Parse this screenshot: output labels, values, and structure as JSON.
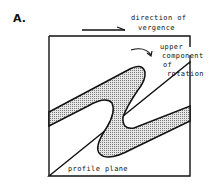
{
  "panel_label": "A.",
  "labels": {
    "direction_line1": "direction of",
    "direction_line2": "vergence",
    "rotation_line1": "upper",
    "rotation_line2": "component",
    "rotation_line3": "of",
    "rotation_line4": "rotation",
    "profile_plane": "profile plane"
  },
  "colors": {
    "ink": "#111111",
    "fill": "#cfcfcf",
    "background": "#ffffff"
  }
}
